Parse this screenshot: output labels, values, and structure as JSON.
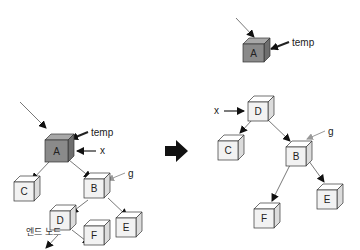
{
  "diagram": {
    "type": "tree-rotation",
    "colors": {
      "highlight_fill": "#8a8a8a",
      "highlight_top": "#a8a8a8",
      "highlight_side": "#6e6e6e",
      "normal_fill": "#f2f2f2",
      "normal_top": "#ffffff",
      "normal_side": "#dcdcdc",
      "stroke": "#333333",
      "pointer_gray": "#999999",
      "arrow_black": "#111111"
    },
    "before": {
      "nodes": [
        {
          "id": "A",
          "label": "A",
          "highlight": true
        },
        {
          "id": "C",
          "label": "C",
          "highlight": false
        },
        {
          "id": "B",
          "label": "B",
          "highlight": false
        },
        {
          "id": "D",
          "label": "D",
          "highlight": false
        },
        {
          "id": "E",
          "label": "E",
          "highlight": false
        },
        {
          "id": "F",
          "label": "F",
          "highlight": false
        }
      ],
      "edges": [
        [
          "A",
          "C"
        ],
        [
          "A",
          "B"
        ],
        [
          "B",
          "D"
        ],
        [
          "B",
          "E"
        ],
        [
          "D",
          "F"
        ],
        [
          "D",
          "end_node"
        ]
      ],
      "pointers": {
        "temp": "temp",
        "x": "x",
        "g": "g"
      },
      "end_node_label": "엔드 노드"
    },
    "transition_arrow": "right-arrow",
    "after": {
      "nodes": [
        {
          "id": "A",
          "label": "A",
          "highlight": true
        },
        {
          "id": "D",
          "label": "D",
          "highlight": false
        },
        {
          "id": "C",
          "label": "C",
          "highlight": false
        },
        {
          "id": "B",
          "label": "B",
          "highlight": false
        },
        {
          "id": "F",
          "label": "F",
          "highlight": false
        },
        {
          "id": "E",
          "label": "E",
          "highlight": false
        }
      ],
      "edges": [
        [
          "D",
          "C"
        ],
        [
          "D",
          "B"
        ],
        [
          "B",
          "F"
        ],
        [
          "B",
          "E"
        ]
      ],
      "pointers": {
        "temp": "temp",
        "x": "x",
        "g": "g"
      }
    }
  }
}
